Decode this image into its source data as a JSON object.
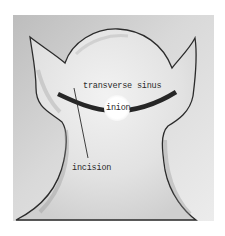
{
  "figure": {
    "labels": {
      "transverse_sinus": "transverse sinus",
      "inion": "inion",
      "incision": "incision"
    },
    "colors": {
      "background_light": "#e9e9e9",
      "background_dark": "#bdbdbd",
      "outline": "#2b2b2b",
      "sinus_bar": "#262626",
      "inion_marker": "#ffffff"
    }
  }
}
